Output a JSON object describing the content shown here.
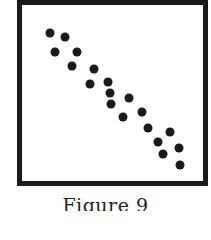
{
  "caption": "Figure 9",
  "colors": {
    "ink": "#1a1a1a",
    "background": "#ffffff"
  },
  "chart_data": {
    "type": "scatter",
    "title": "",
    "caption": "Figure 9",
    "xlabel": "",
    "ylabel": "",
    "axes": {
      "ticks": false,
      "grid": false,
      "frame": true
    },
    "note": "Unlabeled scatter plot showing a strong negative correlation; coordinates are pixel positions in the 211x211 image (x right, y down).",
    "points": [
      {
        "x": 50,
        "y": 33
      },
      {
        "x": 65,
        "y": 37
      },
      {
        "x": 55,
        "y": 52
      },
      {
        "x": 77,
        "y": 52
      },
      {
        "x": 72,
        "y": 66
      },
      {
        "x": 94,
        "y": 69
      },
      {
        "x": 90,
        "y": 84
      },
      {
        "x": 108,
        "y": 82
      },
      {
        "x": 110,
        "y": 93
      },
      {
        "x": 111,
        "y": 104
      },
      {
        "x": 129,
        "y": 98
      },
      {
        "x": 123,
        "y": 117
      },
      {
        "x": 142,
        "y": 112
      },
      {
        "x": 148,
        "y": 128
      },
      {
        "x": 170,
        "y": 132
      },
      {
        "x": 158,
        "y": 142
      },
      {
        "x": 179,
        "y": 148
      },
      {
        "x": 163,
        "y": 154
      },
      {
        "x": 180,
        "y": 165
      }
    ]
  }
}
